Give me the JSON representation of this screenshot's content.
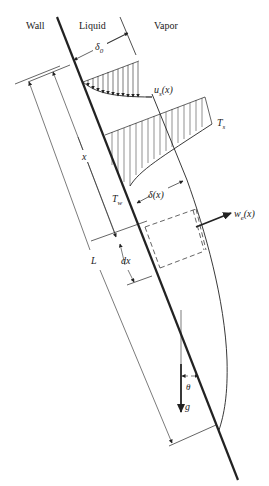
{
  "figure": {
    "region_labels": {
      "wall": "Wall",
      "liquid": "Liquid",
      "vapor": "Vapor"
    },
    "symbols": {
      "delta0": "δ",
      "delta0_sub": "0",
      "us": "u",
      "us_sub": "s",
      "us_arg": "(x)",
      "Ts": "T",
      "Ts_sub": "s",
      "Tw": "T",
      "Tw_sub": "w",
      "delta_x": "δ(x)",
      "we": "w",
      "we_sub": "e",
      "we_arg": "(x)",
      "x": "x",
      "L": "L",
      "dx": "dx",
      "theta": "θ",
      "g": "g"
    },
    "colors": {
      "ink": "#222222",
      "background": "#ffffff"
    }
  }
}
